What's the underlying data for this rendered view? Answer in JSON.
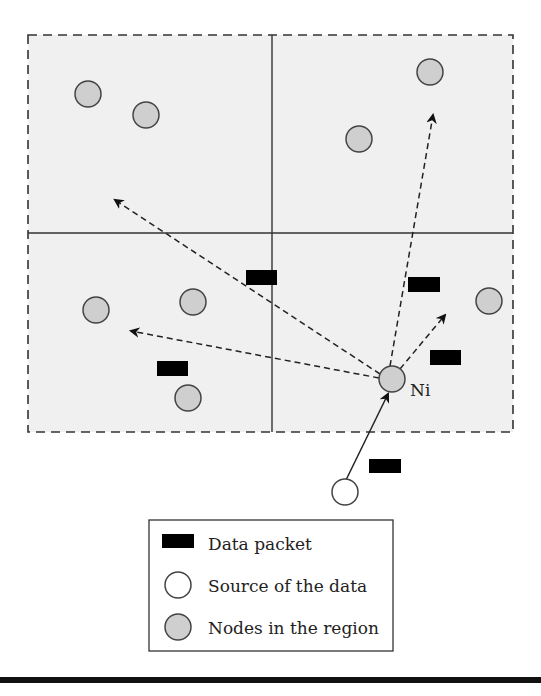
{
  "diagram": {
    "type": "network-forwarding",
    "region_fill": "#f0f0f0",
    "node_fill": "#cfcfcf",
    "packet_color": "#000000",
    "forwarding_node_label": "Ni",
    "quadrants": [
      "top-left",
      "top-right",
      "bottom-left",
      "bottom-right"
    ],
    "nodes_in_region_count": 10,
    "data_packets_count": 6,
    "source_count": 1,
    "forwarding_arrows_count": 4
  },
  "legend": {
    "items": [
      {
        "label": "Data packet",
        "symbol": "packet"
      },
      {
        "label": "Source of the data",
        "symbol": "source"
      },
      {
        "label": "Nodes in the region",
        "symbol": "node"
      }
    ]
  }
}
